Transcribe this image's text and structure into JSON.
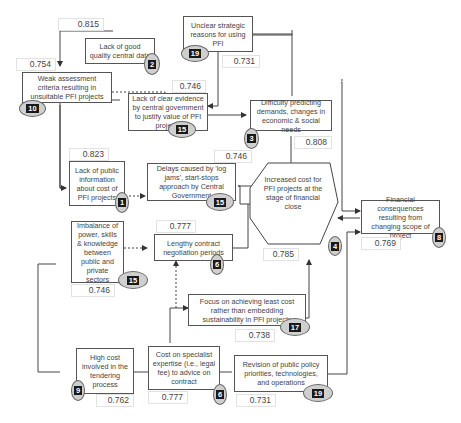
{
  "nodes": {
    "n2": {
      "label": "Lack of good quality central data",
      "rank": "2",
      "score": "0.815"
    },
    "n19a": {
      "label": "Unclear strategic reasons for using PFI",
      "rank": "19",
      "score": "0.731"
    },
    "n10": {
      "label": "Weak assessment criteria resulting in unsuitable PFI projects",
      "rank": "10",
      "score": "0.754"
    },
    "n15a": {
      "label": "Lack of clear evidence by central government to justify value of PFI projects",
      "rank": "15",
      "score": "0.746"
    },
    "n3": {
      "label": "Difficulty predicting demands, changes in economic & social needs",
      "rank": "3",
      "score": "0.808"
    },
    "n1": {
      "label": "Lack of public information about cost of PFI projects",
      "rank": "1",
      "score": "0.823"
    },
    "n15b": {
      "label": "Delays caused by 'log jams', start-stops approach by Central Government",
      "rank": "15",
      "score": "0.746"
    },
    "n4": {
      "label": "Increased cost for PFI projects at the stage of financial close",
      "rank": "4",
      "score": "0.785"
    },
    "n8": {
      "label": "Financial consequences resulting from changing scope of project",
      "rank": "8",
      "score": "0.769"
    },
    "n15c": {
      "label": "Imbalance of power, skills & knowledge between public and private sectors",
      "rank": "15",
      "score": "0.746"
    },
    "n6a": {
      "label": "Lengthy contract negotiation periods",
      "rank": "6",
      "score": "0.777"
    },
    "n17": {
      "label": "Focus on achieving least cost rather than embedding sustainability in PFI projects",
      "rank": "17",
      "score": "0.738"
    },
    "n9": {
      "label": "High cost involved in the tendering process",
      "rank": "9",
      "score": "0.762"
    },
    "n6b": {
      "label": "Cost on specialist expertise (i.e., legal fee) to advice on contract",
      "rank": "6",
      "score": "0.777"
    },
    "n19b": {
      "label": "Revision of public policy priorities, technologies, and operations",
      "rank": "19",
      "score": "0.731"
    }
  },
  "colors": {
    "line": "#444444",
    "badge_fill": "#cfcfcf",
    "badge_text_bg": "#1a1a1a"
  }
}
